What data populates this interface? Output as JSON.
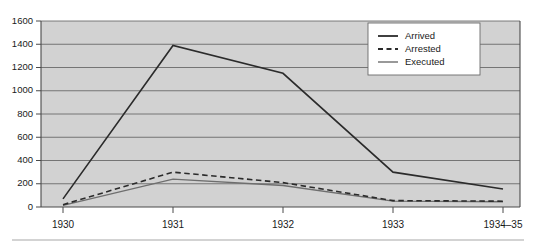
{
  "chart_data": {
    "type": "line",
    "title": "",
    "subtitle": "",
    "xlabel": "",
    "ylabel": "",
    "categories": [
      "1930",
      "1931",
      "1932",
      "1933",
      "1934–35"
    ],
    "series": [
      {
        "name": "Arrived",
        "values": [
          70,
          1390,
          1150,
          300,
          155
        ],
        "style": "solid-black"
      },
      {
        "name": "Arrested",
        "values": [
          20,
          300,
          210,
          55,
          50
        ],
        "style": "dashed-black"
      },
      {
        "name": "Executed",
        "values": [
          15,
          240,
          185,
          50,
          45
        ],
        "style": "solid-gray"
      }
    ],
    "ylim": [
      0,
      1600
    ],
    "ytick_labels": [
      "0",
      "200",
      "400",
      "600",
      "800",
      "1000",
      "1200",
      "1400",
      "1600"
    ],
    "ytick_values": [
      0,
      200,
      400,
      600,
      800,
      1000,
      1200,
      1400,
      1600
    ],
    "grid": true,
    "grid_axis": "y",
    "legend_position": "top-right",
    "legend_entries": [
      "Arrived",
      "Arrested",
      "Executed"
    ],
    "plot_background_color": "#d2d2d2",
    "figure_background_color": "#ffffff",
    "line_colors": {
      "arrived": "#2b2b2b",
      "arrested": "#2b2b2b",
      "executed": "#6e6e6e"
    }
  }
}
